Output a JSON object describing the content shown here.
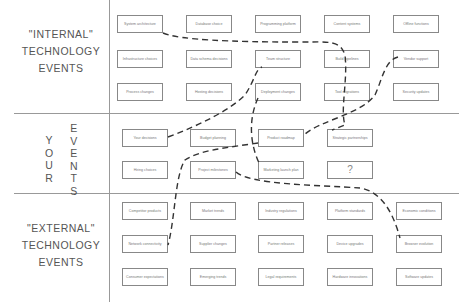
{
  "rows": {
    "internal": {
      "label_line1": "\"INTERNAL\"",
      "label_line2": "TECHNOLOGY",
      "label_line3": "EVENTS"
    },
    "your": {
      "col1": [
        "Y",
        "O",
        "U",
        "R"
      ],
      "col2": [
        "E",
        "V",
        "E",
        "N",
        "T",
        "S"
      ]
    },
    "external": {
      "label_line1": "\"EXTERNAL\"",
      "label_line2": "TECHNOLOGY",
      "label_line3": "EVENTS"
    }
  },
  "boxes": {
    "internal": [
      [
        "System architecture",
        "Database choice",
        "Programming platform",
        "Content systems",
        "Offline functions"
      ],
      [
        "Infrastructure choices",
        "Data schema decisions",
        "Team structure",
        "Build pipelines",
        "Vendor support"
      ],
      [
        "Process changes",
        "Hosting decisions",
        "Deployment changes",
        "Tool migrations",
        "Security updates"
      ]
    ],
    "your": [
      [
        "Your decisions",
        "Budget planning",
        "Product roadmap",
        "Strategic partnerships"
      ],
      [
        "Hiring choices",
        "Project milestones",
        "Marketing launch plan",
        "?"
      ]
    ],
    "external": [
      [
        "Competitor products",
        "Market trends",
        "Industry regulations",
        "Platform standards",
        "Economic conditions"
      ],
      [
        "Network connectivity",
        "Supplier changes",
        "Partner releases",
        "Device upgrades",
        "Browser evolution"
      ],
      [
        "Consumer expectations",
        "Emerging trends",
        "Legal requirements",
        "Hardware innovations",
        "Software updates"
      ]
    ]
  }
}
